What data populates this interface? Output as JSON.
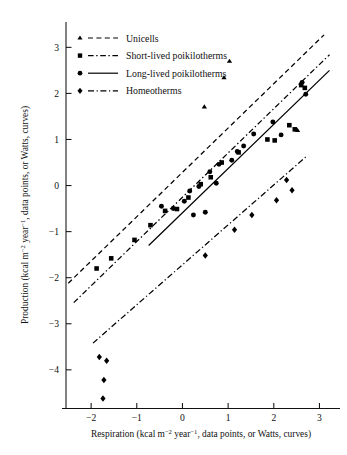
{
  "figure": {
    "title": "",
    "width": 347,
    "height": 455
  },
  "axes": {
    "x": {
      "label_main": "Respiration (kcal m",
      "label_sup1": "−2",
      "label_mid": " year",
      "label_sup2": "−1",
      "label_tail": ", data points, or Watts, curves)",
      "label_full": "Respiration (kcal m−2 year−1, data points, or Watts, curves)",
      "ticks": [
        "−2",
        "−1",
        "0",
        "1",
        "2",
        "3"
      ],
      "tick_values": [
        -2,
        -1,
        0,
        1,
        2,
        3
      ],
      "range": [
        -2.55,
        3.45
      ]
    },
    "y": {
      "label_main": "Production (kcal m",
      "label_sup1": "−2",
      "label_mid": " year",
      "label_sup2": "−1",
      "label_tail": ", data points, or Watts, curves)",
      "label_full": "Production (kcal m−2 year−1, data points, or Watts, curves)",
      "ticks": [
        "3",
        "2",
        "1",
        "0",
        "−1",
        "−2",
        "−3",
        "−4"
      ],
      "tick_values": [
        3,
        2,
        1,
        0,
        -1,
        -2,
        -3,
        -4
      ],
      "range": [
        -4.85,
        3.55
      ]
    }
  },
  "legend": {
    "items": [
      {
        "marker": "triangle",
        "line": "dashed",
        "label": "Unicells"
      },
      {
        "marker": "square",
        "line": "dash-dash",
        "label": "Short-lived poikilotherms"
      },
      {
        "marker": "circle",
        "line": "solid",
        "label": "Long-lived poikilotherms"
      },
      {
        "marker": "diamond",
        "line": "dash-dot",
        "label": "Homeotherms"
      }
    ]
  },
  "chart_data": {
    "type": "scatter",
    "title": "",
    "xlabel": "Respiration (kcal m−2 year−1, data points, or Watts, curves)",
    "ylabel": "Production (kcal m−2 year−1, data points, or Watts, curves)",
    "xlim": [
      -2.55,
      3.45
    ],
    "ylim": [
      -4.85,
      3.55
    ],
    "grid": false,
    "legend_position": "upper-left",
    "series": [
      {
        "name": "Unicells",
        "marker": "triangle",
        "line_style": "dashed",
        "points": [
          [
            1.03,
            2.7
          ],
          [
            0.91,
            2.34
          ],
          [
            0.48,
            1.71
          ],
          [
            2.52,
            1.2
          ]
        ],
        "fit_line": {
          "x": [
            -2.5,
            3.1
          ],
          "y": [
            -2.12,
            3.27
          ]
        }
      },
      {
        "name": "Short-lived poikilotherms",
        "marker": "square",
        "line_style": "dash-dash",
        "points": [
          [
            2.6,
            2.18
          ],
          [
            2.68,
            2.12
          ],
          [
            2.34,
            1.31
          ],
          [
            2.46,
            1.22
          ],
          [
            1.86,
            1.0
          ],
          [
            2.02,
            0.98
          ],
          [
            1.23,
            0.72
          ],
          [
            0.86,
            0.5
          ],
          [
            0.62,
            0.18
          ],
          [
            0.4,
            0.03
          ],
          [
            0.13,
            -0.26
          ],
          [
            -0.12,
            -0.51
          ],
          [
            -0.38,
            -0.55
          ],
          [
            -0.7,
            -0.86
          ],
          [
            -1.05,
            -1.18
          ],
          [
            -1.56,
            -1.58
          ],
          [
            -1.88,
            -1.8
          ]
        ],
        "fit_line": {
          "x": [
            -2.38,
            3.22
          ],
          "y": [
            -2.54,
            2.84
          ]
        }
      },
      {
        "name": "Long-lived poikilotherms",
        "marker": "circle",
        "line_style": "solid",
        "points": [
          [
            2.62,
            2.24
          ],
          [
            2.7,
            1.98
          ],
          [
            1.98,
            1.38
          ],
          [
            2.16,
            1.1
          ],
          [
            1.56,
            1.12
          ],
          [
            1.34,
            0.86
          ],
          [
            1.2,
            0.74
          ],
          [
            1.08,
            0.55
          ],
          [
            0.8,
            0.46
          ],
          [
            0.6,
            0.3
          ],
          [
            0.74,
            0.05
          ],
          [
            0.36,
            -0.02
          ],
          [
            0.16,
            -0.12
          ],
          [
            0.04,
            -0.34
          ],
          [
            -0.2,
            -0.5
          ],
          [
            -0.46,
            -0.45
          ],
          [
            0.5,
            -0.58
          ],
          [
            0.24,
            -0.64
          ]
        ],
        "fit_line": {
          "x": [
            -0.74,
            3.22
          ],
          "y": [
            -1.3,
            2.5
          ]
        }
      },
      {
        "name": "Homeotherms",
        "marker": "diamond",
        "line_style": "dash-dot",
        "points": [
          [
            2.28,
            0.12
          ],
          [
            2.4,
            -0.1
          ],
          [
            2.06,
            -0.32
          ],
          [
            1.52,
            -0.64
          ],
          [
            1.14,
            -0.96
          ],
          [
            0.5,
            -1.52
          ],
          [
            -1.82,
            -3.72
          ],
          [
            -1.66,
            -3.8
          ],
          [
            -1.72,
            -4.22
          ],
          [
            -1.74,
            -4.62
          ]
        ],
        "fit_line": {
          "x": [
            -1.96,
            2.7
          ],
          "y": [
            -3.42,
            0.62
          ]
        }
      }
    ]
  }
}
